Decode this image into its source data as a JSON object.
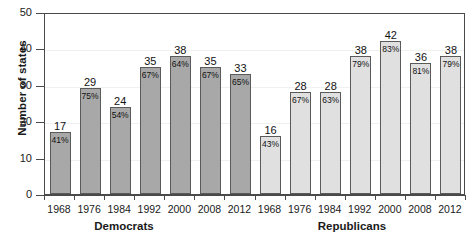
{
  "chart_data": {
    "type": "bar",
    "title": "",
    "xlabel": "",
    "ylabel": "Number of states",
    "ylim": [
      0,
      50
    ],
    "yticks": [
      0,
      10,
      20,
      30,
      40,
      50
    ],
    "grid": true,
    "legend": "none",
    "groups": [
      {
        "name": "Democrats",
        "color": "#a8a8a8",
        "categories": [
          "1968",
          "1976",
          "1984",
          "1992",
          "2000",
          "2008",
          "2012"
        ],
        "values": [
          17,
          29,
          24,
          35,
          38,
          35,
          33
        ],
        "pct_labels": [
          "41%",
          "75%",
          "54%",
          "67%",
          "64%",
          "67%",
          "65%"
        ]
      },
      {
        "name": "Republicans",
        "color": "#e0e0e0",
        "categories": [
          "1968",
          "1976",
          "1984",
          "1992",
          "2000",
          "2008",
          "2012"
        ],
        "values": [
          16,
          28,
          28,
          38,
          42,
          36,
          38
        ],
        "pct_labels": [
          "43%",
          "67%",
          "63%",
          "79%",
          "83%",
          "81%",
          "79%"
        ]
      }
    ]
  },
  "axis": {
    "y_title": "Number of states",
    "y_labels": [
      "50",
      "40",
      "30",
      "20",
      "10",
      "0"
    ]
  },
  "group_labels": {
    "left": "Democrats",
    "right": "Republicans"
  }
}
